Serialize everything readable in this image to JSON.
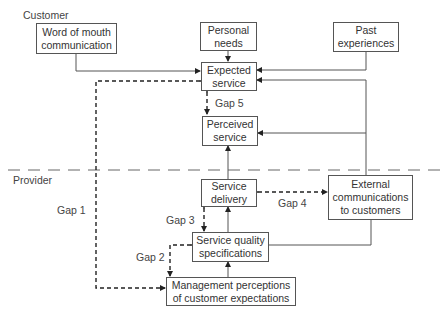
{
  "diagram": {
    "regions": {
      "customer": "Customer",
      "provider": "Provider"
    },
    "nodes": {
      "word_of_mouth": "Word of mouth\ncommunication",
      "personal_needs": "Personal\nneeds",
      "past_experiences": "Past\nexperiences",
      "expected_service": "Expected\nservice",
      "perceived_service": "Perceived\nservice",
      "service_delivery": "Service\ndelivery",
      "external_communications": "External\ncommunications\nto customers",
      "service_quality_specs": "Service quality\nspecifications",
      "management_perceptions": "Management perceptions\nof customer expectations"
    },
    "gaps": {
      "gap1": "Gap 1",
      "gap2": "Gap 2",
      "gap3": "Gap 3",
      "gap4": "Gap 4",
      "gap5": "Gap 5"
    },
    "edges": [
      {
        "from": "word_of_mouth",
        "to": "expected_service",
        "style": "solid"
      },
      {
        "from": "personal_needs",
        "to": "expected_service",
        "style": "solid"
      },
      {
        "from": "past_experiences",
        "to": "expected_service",
        "style": "solid"
      },
      {
        "from": "external_communications",
        "to": "expected_service",
        "style": "solid"
      },
      {
        "from": "external_communications",
        "to": "perceived_service",
        "style": "solid"
      },
      {
        "from": "service_delivery",
        "to": "perceived_service",
        "style": "solid"
      },
      {
        "from": "service_quality_specs",
        "to": "service_delivery",
        "style": "solid"
      },
      {
        "from": "service_quality_specs",
        "to": "external_communications",
        "style": "solid"
      },
      {
        "from": "management_perceptions",
        "to": "service_quality_specs",
        "style": "solid"
      },
      {
        "from": "expected_service",
        "to": "management_perceptions",
        "style": "dashed",
        "label": "gap1"
      },
      {
        "from": "service_quality_specs",
        "to": "management_perceptions",
        "style": "dashed",
        "label": "gap2"
      },
      {
        "from": "service_delivery",
        "to": "service_quality_specs",
        "style": "dashed",
        "label": "gap3"
      },
      {
        "from": "service_delivery",
        "to": "external_communications",
        "style": "dashed",
        "label": "gap4"
      },
      {
        "from": "expected_service",
        "to": "perceived_service",
        "style": "dashed",
        "label": "gap5"
      }
    ]
  }
}
